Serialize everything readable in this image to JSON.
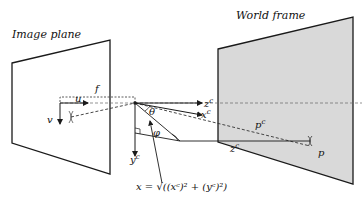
{
  "titles": {
    "image_plane": "Image plane",
    "world_frame": "World frame"
  },
  "labels": {
    "f": "f",
    "u": "u",
    "v": "v",
    "z": "z",
    "x": "x",
    "y": "y",
    "c": "c",
    "theta": "θ",
    "phi": "φ",
    "p": "p",
    "pc": "p",
    "formula": "x = √((xᶜ)² + (yᶜ)²)"
  },
  "colors": {
    "world_fill": "#d9d9d9",
    "line": "#1a1a1a"
  }
}
